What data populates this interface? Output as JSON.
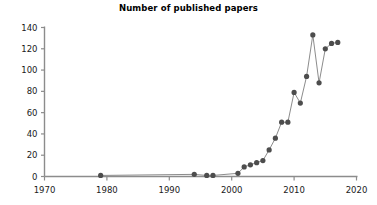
{
  "chart_data": {
    "type": "line",
    "title": "Number of published papers",
    "xlabel": "",
    "ylabel": "",
    "xlim": [
      1970,
      2020
    ],
    "ylim": [
      0,
      140
    ],
    "xticks": [
      1970,
      1980,
      1990,
      2000,
      2010,
      2020
    ],
    "yticks": [
      0,
      20,
      40,
      60,
      80,
      100,
      120,
      140
    ],
    "grid": false,
    "legend": null,
    "marker": "filled-circle",
    "marker_color": "#4d4d4d",
    "line_color": "#8c8c8c",
    "axis_color": "#8c8c8c",
    "x": [
      1979,
      1994,
      1996,
      1997,
      2001,
      2002,
      2003,
      2004,
      2005,
      2006,
      2007,
      2008,
      2009,
      2010,
      2011,
      2012,
      2013,
      2014,
      2015,
      2016,
      2017
    ],
    "values": [
      1,
      2,
      1,
      1,
      3,
      9,
      11,
      13,
      15,
      25,
      36,
      51,
      51,
      79,
      69,
      94,
      133,
      88,
      120,
      125,
      126
    ],
    "series": [
      {
        "name": "Number of published papers",
        "x": [
          1979,
          1994,
          1996,
          1997,
          2001,
          2002,
          2003,
          2004,
          2005,
          2006,
          2007,
          2008,
          2009,
          2010,
          2011,
          2012,
          2013,
          2014,
          2015,
          2016,
          2017
        ],
        "values": [
          1,
          2,
          1,
          1,
          3,
          9,
          11,
          13,
          15,
          25,
          36,
          51,
          51,
          79,
          69,
          94,
          133,
          88,
          120,
          125,
          126
        ]
      }
    ]
  },
  "axis_labels": {
    "y": [
      "140",
      "120",
      "100",
      "80",
      "60",
      "40",
      "20",
      "0"
    ],
    "x": [
      "1970",
      "1980",
      "1990",
      "2000",
      "2010",
      "2020"
    ]
  }
}
